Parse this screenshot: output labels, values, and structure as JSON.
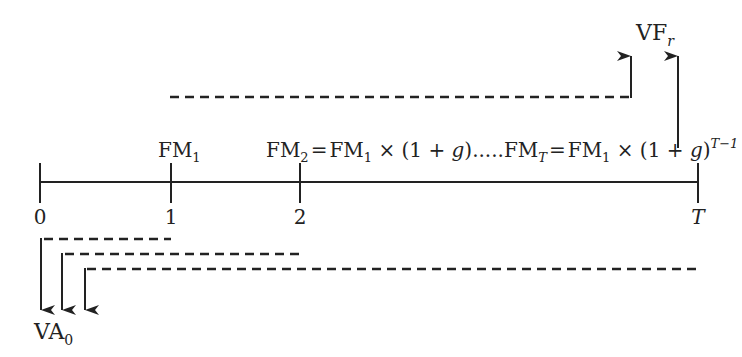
{
  "diagram": {
    "type": "cash-flow-timeline",
    "timeline": {
      "ticks": [
        {
          "label": "0",
          "italic": false
        },
        {
          "label": "1",
          "italic": false
        },
        {
          "label": "2",
          "italic": false
        },
        {
          "label": "T",
          "italic": true
        }
      ]
    },
    "cash_flows": {
      "fm1": {
        "base": "FM",
        "sub": "1"
      },
      "fm2_formula": {
        "lhs_base": "FM",
        "lhs_sub": "2",
        "eq": "=",
        "rhs_base": "FM",
        "rhs_sub": "1",
        "rhs_tail": " × (1 + ",
        "g": "g",
        "close": ")",
        "dots": "....."
      },
      "fmT_formula": {
        "lhs_base": "FM",
        "lhs_sub": "T",
        "eq": "=",
        "rhs_base": "FM",
        "rhs_sub": "1",
        "rhs_tail": " × (1 + ",
        "g": "g",
        "close": ")",
        "exponent": "T−1"
      }
    },
    "future_value": {
      "base": "VF",
      "sub": "r"
    },
    "present_value": {
      "base": "VA",
      "sub": "0"
    },
    "colors": {
      "line": "#222222",
      "text": "#222222",
      "background": "#ffffff"
    }
  }
}
